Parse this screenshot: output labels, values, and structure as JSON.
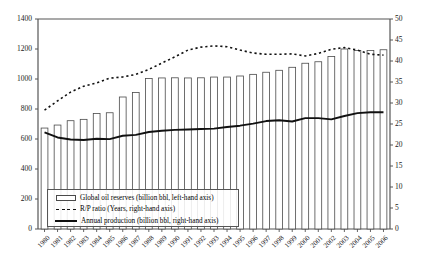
{
  "chart_data": {
    "type": "bar",
    "title": "",
    "subtitle": "",
    "xlabel": "",
    "ylabel": "",
    "y2label": "",
    "grid": false,
    "legend_position": "inside-bottom-left",
    "ylim": [
      0,
      1400
    ],
    "y2lim": [
      0,
      50
    ],
    "yticks": [
      0,
      200,
      400,
      600,
      800,
      1000,
      1200,
      1400
    ],
    "y2ticks": [
      0,
      5,
      10,
      15,
      20,
      25,
      30,
      35,
      40,
      45,
      50
    ],
    "categories": [
      "1980",
      "1981",
      "1982",
      "1983",
      "1984",
      "1985",
      "1986",
      "1987",
      "1988",
      "1989",
      "1990",
      "1991",
      "1992",
      "1993",
      "1994",
      "1995",
      "1996",
      "1997",
      "1998",
      "1999",
      "2000",
      "2001",
      "2002",
      "2003",
      "2004",
      "2005",
      "2006"
    ],
    "series": [
      {
        "name": "Global oil reserves (billion bbl, left-hand axis)",
        "type": "bar",
        "axis": "left",
        "unit": "billion bbl",
        "values": [
          673,
          693,
          722,
          731,
          770,
          775,
          880,
          910,
          1003,
          1007,
          1008,
          1007,
          1008,
          1013,
          1013,
          1020,
          1031,
          1045,
          1058,
          1078,
          1105,
          1115,
          1150,
          1200,
          1190,
          1190,
          1195
        ]
      },
      {
        "name": "R/P ratio (Years, right-hand axis)",
        "type": "line-dotted",
        "axis": "right",
        "unit": "Years",
        "values": [
          28.3,
          30.5,
          32.6,
          34.0,
          34.8,
          35.9,
          36.2,
          36.8,
          38.0,
          39.5,
          41.0,
          42.6,
          43.3,
          43.6,
          43.4,
          42.6,
          41.9,
          41.6,
          41.6,
          41.7,
          41.2,
          41.8,
          42.8,
          43.2,
          42.6,
          41.6,
          41.4
        ]
      },
      {
        "name": "Annual production (billion bbl, right-hand axis)",
        "type": "line-solid",
        "axis": "right",
        "unit": "billion bbl",
        "values": [
          23.0,
          21.8,
          21.3,
          21.2,
          21.5,
          21.4,
          22.2,
          22.4,
          23.1,
          23.4,
          23.6,
          23.7,
          23.8,
          23.9,
          24.3,
          24.6,
          25.1,
          25.7,
          25.9,
          25.6,
          26.4,
          26.4,
          26.1,
          26.9,
          27.6,
          27.8,
          27.8
        ]
      }
    ]
  },
  "legend": {
    "items": [
      {
        "label": "Global oil reserves (billion bbl, left-hand axis)",
        "marker": "bar-swatch-icon"
      },
      {
        "label": "R/P ratio (Years, right-hand axis)",
        "marker": "dotted-line-icon"
      },
      {
        "label": "Annual production (billion bbl, right-hand axis)",
        "marker": "solid-line-icon"
      }
    ]
  },
  "colors": {
    "bar_stroke": "#4a4a4a",
    "bar_fill": "#ffffff",
    "dotted_line": "#111111",
    "solid_line": "#111111",
    "axis": "#555555",
    "text": "#1a1a1a"
  }
}
